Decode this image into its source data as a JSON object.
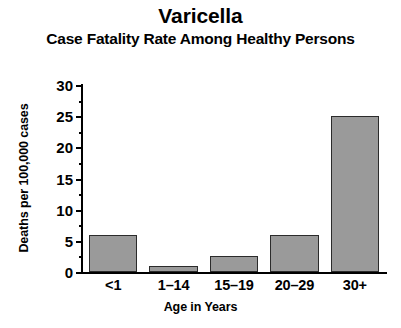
{
  "chart_data": {
    "type": "bar",
    "title": "Varicella",
    "subtitle": "Case Fatality Rate Among Healthy Persons",
    "xlabel": "Age in Years",
    "ylabel": "Deaths per 100,000 cases",
    "categories": [
      "<1",
      "1–14",
      "15–19",
      "20–29",
      "30+"
    ],
    "values": [
      6,
      1,
      2.5,
      6,
      25
    ],
    "ylim": [
      0,
      30
    ],
    "ytick_labels": [
      "0",
      "5",
      "10",
      "15",
      "20",
      "25",
      "30"
    ],
    "ytick_values": [
      0,
      5,
      10,
      15,
      20,
      25,
      30
    ],
    "yminor_values": [
      2.5,
      7.5,
      12.5,
      17.5,
      22.5,
      27.5
    ],
    "grid": false,
    "legend": false,
    "bar_color": "#9a9a9a",
    "bar_edge_color": "#2b2b2b",
    "axis_color": "#000000",
    "background": "#ffffff"
  }
}
